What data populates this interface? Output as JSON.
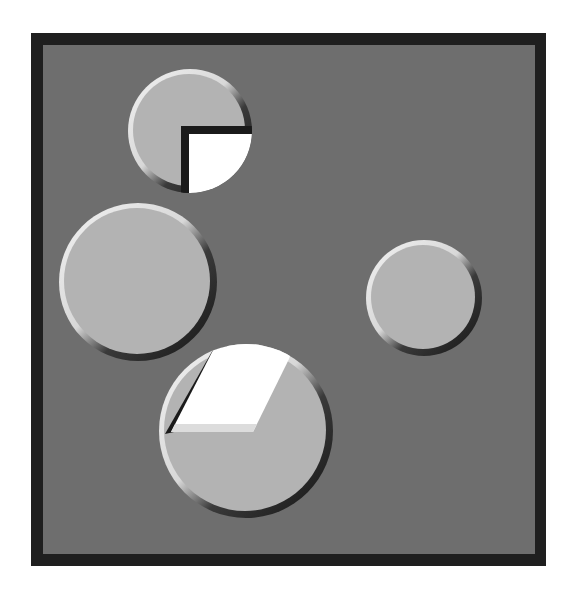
{
  "canvas": {
    "width": 575,
    "height": 595,
    "page_bg": "#ffffff"
  },
  "board": {
    "frame": {
      "x": 31,
      "y": 33,
      "w": 515,
      "h": 533,
      "color": "#1f1f1f"
    },
    "field": {
      "x": 43,
      "y": 45,
      "w": 492,
      "h": 509,
      "color": "#6e6e6e"
    }
  },
  "style": {
    "face": "#b3b3b3",
    "rim_light": "#ececec",
    "rim_dark": "#1c1c1c",
    "hole": "#ffffff",
    "hole_shadow": "#1a1a1a",
    "hole_bevel": "#dcdcdc"
  },
  "pieces": [
    {
      "id": "top-circle",
      "cx": 190,
      "cy": 131,
      "r": 62,
      "wedge": "quarter-bottom-right",
      "wedge_corner": [
        189,
        134
      ],
      "band_corner": [
        181,
        126
      ]
    },
    {
      "id": "left-circle",
      "cx": 138,
      "cy": 282,
      "r": 79,
      "wedge": "none"
    },
    {
      "id": "right-circle",
      "cx": 424,
      "cy": 298,
      "r": 58,
      "wedge": "none"
    },
    {
      "id": "bottom-circle",
      "cx": 246,
      "cy": 431,
      "r": 87,
      "wedge": "parallelogram-top-left",
      "wedge_points": [
        [
          228,
          345
        ],
        [
          289,
          359
        ],
        [
          253,
          432
        ],
        [
          171,
          432
        ]
      ]
    }
  ]
}
